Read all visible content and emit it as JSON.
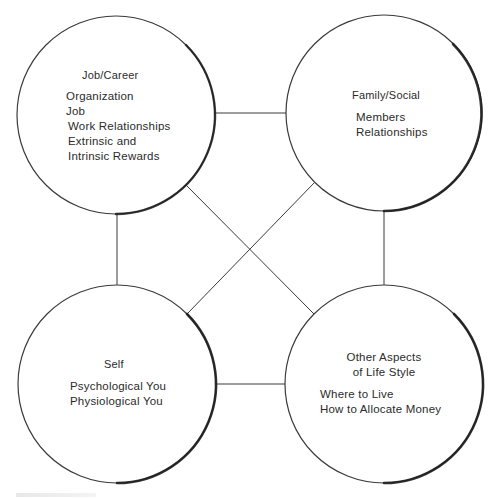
{
  "diagram": {
    "type": "network-of-circles",
    "colors": {
      "stroke": "#3a3a3a",
      "heavy_stroke": "#1e1e1e",
      "background": "#ffffff",
      "text": "#2b2b2b"
    },
    "nodes": [
      {
        "id": "job-career",
        "title": "Job/Career",
        "items": [
          "Organization",
          "Job",
          "Work Relationships",
          "Extrinsic and",
          "Intrinsic Rewards"
        ],
        "cx": 116,
        "cy": 115,
        "r": 99
      },
      {
        "id": "family-social",
        "title": "Family/Social",
        "items": [
          "Members",
          "Relationships"
        ],
        "cx": 384,
        "cy": 113,
        "r": 98
      },
      {
        "id": "self",
        "title": "Self",
        "items": [
          "Psychological You",
          "Physiological You"
        ],
        "cx": 117,
        "cy": 384,
        "r": 99
      },
      {
        "id": "other-aspects",
        "title_lines": [
          "Other Aspects",
          "of Life Style"
        ],
        "items": [
          "Where to Live",
          "How to Allocate Money"
        ],
        "cx": 384,
        "cy": 384,
        "r": 99
      }
    ],
    "edges": [
      {
        "from": "job-career",
        "to": "family-social"
      },
      {
        "from": "job-career",
        "to": "self"
      },
      {
        "from": "family-social",
        "to": "other-aspects"
      },
      {
        "from": "self",
        "to": "other-aspects"
      },
      {
        "from": "job-career",
        "to": "other-aspects"
      },
      {
        "from": "family-social",
        "to": "self"
      }
    ]
  }
}
